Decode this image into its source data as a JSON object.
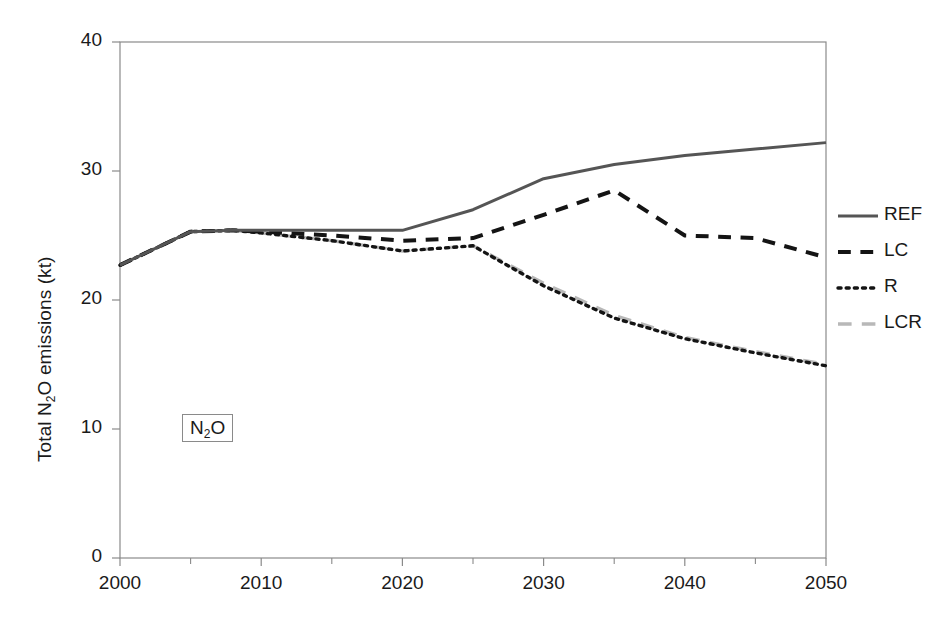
{
  "chart_data": {
    "type": "line",
    "title": "",
    "xlabel": "",
    "ylabel": "Total N2O emissions (kt)",
    "ylabel_parts": {
      "pre": "Total N",
      "sub": "2",
      "post": "O emissions (kt)"
    },
    "annotation": {
      "text": "N2O",
      "parts": {
        "pre": "N",
        "sub": "2",
        "post": "O"
      },
      "boxed": true
    },
    "xlim": [
      2000,
      2050
    ],
    "ylim": [
      0,
      40
    ],
    "grid": false,
    "legend_position": "right",
    "ytick_labels": [
      "40",
      "30",
      "20",
      "10",
      "0"
    ],
    "yticks": [
      40,
      30,
      20,
      10,
      0
    ],
    "xtick_labels": [
      "2000",
      "2010",
      "2020",
      "2030",
      "2040",
      "2050"
    ],
    "xticks": [
      2000,
      2010,
      2020,
      2030,
      2040,
      2050
    ],
    "xminor_ticks": [
      2005,
      2015,
      2025,
      2035,
      2045
    ],
    "x": [
      2000,
      2005,
      2008,
      2010,
      2015,
      2020,
      2025,
      2030,
      2035,
      2040,
      2045,
      2050
    ],
    "series": [
      {
        "name": "REF",
        "color": "#555555",
        "style": "solid",
        "values": [
          22.7,
          25.3,
          25.4,
          25.4,
          25.4,
          25.4,
          27.0,
          29.4,
          30.5,
          31.2,
          31.7,
          32.2
        ]
      },
      {
        "name": "LC",
        "color": "#141414",
        "style": "dashed",
        "values": [
          22.7,
          25.3,
          25.4,
          25.3,
          25.0,
          24.6,
          24.8,
          26.6,
          28.5,
          25.0,
          24.8,
          23.3
        ]
      },
      {
        "name": "R",
        "color": "#141414",
        "style": "dotted",
        "values": [
          22.7,
          25.3,
          25.4,
          25.2,
          24.6,
          23.8,
          24.2,
          21.1,
          18.6,
          17.0,
          15.9,
          14.9
        ]
      },
      {
        "name": "LCR",
        "color": "#b8b8b8",
        "style": "longdash",
        "values": [
          22.7,
          25.3,
          25.4,
          25.2,
          24.6,
          23.8,
          24.2,
          21.3,
          18.8,
          17.1,
          16.0,
          15.0
        ]
      }
    ]
  },
  "legend": {
    "items": [
      {
        "label": "REF",
        "color": "#555555",
        "style": "solid"
      },
      {
        "label": "LC",
        "color": "#141414",
        "style": "dashed"
      },
      {
        "label": "R",
        "color": "#141414",
        "style": "dotted"
      },
      {
        "label": "LCR",
        "color": "#b8b8b8",
        "style": "longdash"
      }
    ]
  },
  "axes": {
    "frame_color": "#8a8a8a",
    "tick_color": "#8a8a8a"
  }
}
